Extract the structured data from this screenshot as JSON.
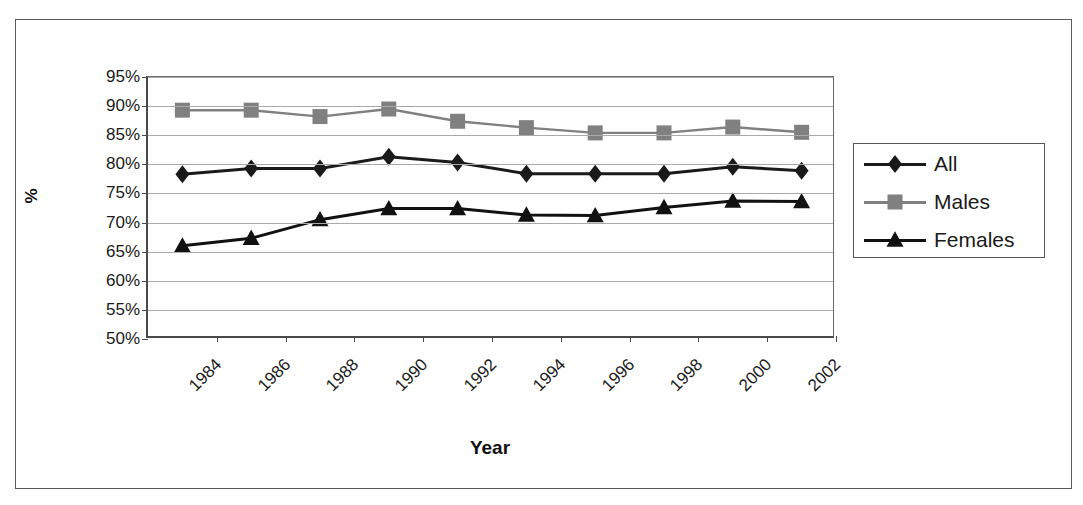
{
  "chart_data": {
    "type": "line",
    "title": "",
    "xlabel": "Year",
    "ylabel": "%",
    "ylim": [
      50,
      95
    ],
    "ytick_step": 5,
    "grid": true,
    "legend_position": "right",
    "ytick_labels": [
      "95%",
      "90%",
      "85%",
      "80%",
      "75%",
      "70%",
      "65%",
      "60%",
      "55%",
      "50%"
    ],
    "ytick_values": [
      95,
      90,
      85,
      80,
      75,
      70,
      65,
      60,
      55,
      50
    ],
    "x": [
      1985,
      1987,
      1989,
      1991,
      1993,
      1995,
      1997,
      1999,
      2001,
      2003
    ],
    "xtick_labels": [
      "1984",
      "1986",
      "1988",
      "1990",
      "1992",
      "1994",
      "1996",
      "1998",
      "2000",
      "2002"
    ],
    "xtick_values": [
      1984,
      1986,
      1988,
      1990,
      1992,
      1994,
      1996,
      1998,
      2000,
      2002
    ],
    "series": [
      {
        "name": "All",
        "marker": "diamond",
        "color": "#1a1a1a",
        "values": [
          78.3,
          79.3,
          79.3,
          81.3,
          80.3,
          78.4,
          78.4,
          78.4,
          79.6,
          78.9
        ]
      },
      {
        "name": "Males",
        "marker": "square",
        "color": "#808080",
        "values": [
          89.3,
          89.3,
          88.2,
          89.5,
          87.4,
          86.3,
          85.4,
          85.4,
          86.4,
          85.5
        ]
      },
      {
        "name": "Females",
        "marker": "triangle",
        "color": "#111111",
        "values": [
          66.0,
          67.3,
          70.5,
          72.4,
          72.4,
          71.3,
          71.2,
          72.6,
          73.7,
          73.6
        ]
      }
    ]
  },
  "legend": {
    "items": [
      {
        "label": "All",
        "marker": "diamond",
        "color": "#1a1a1a"
      },
      {
        "label": "Males",
        "marker": "square",
        "color": "#808080"
      },
      {
        "label": "Females",
        "marker": "triangle",
        "color": "#111111"
      }
    ]
  },
  "axes": {
    "x_title": "Year",
    "y_title": "%"
  }
}
